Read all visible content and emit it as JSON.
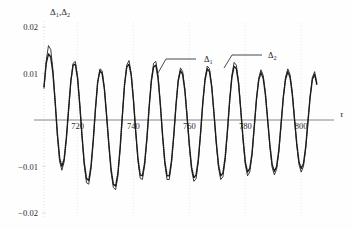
{
  "figure": {
    "background_color": "#fefefe",
    "ink_color": "#1a1a1a",
    "axis_color": "#7a7a7a",
    "gridline_color": "#d8d8d8"
  },
  "axes": {
    "ylabel": "Δ₁,Δ₂",
    "ylabel_parts": {
      "delta": "Δ",
      "sub1": "1",
      "comma": ",",
      "sub2": "2"
    },
    "xlabel": "τ",
    "x_ticks": [
      720,
      740,
      760,
      780,
      800
    ],
    "x_tick_labels": [
      "720",
      "740",
      "760",
      "780",
      "800"
    ],
    "y_ticks": [
      0.02,
      0.01,
      -0.01,
      -0.02
    ],
    "y_tick_labels": [
      "0.02",
      "0.01",
      "−0.01",
      "−0.02"
    ],
    "xlim": [
      708,
      806
    ],
    "ylim": [
      -0.022,
      0.022
    ],
    "zero_line": true,
    "grid": "faint-dotted"
  },
  "annotations": [
    {
      "name": "delta-1-callout",
      "label": "Δ₁",
      "base": "Δ",
      "sub": "1",
      "text_x": 204,
      "text_y": 62,
      "leader_from_x": 196,
      "leader_from_y": 59,
      "leader_to_x": 166,
      "leader_to_y": 59,
      "leader_tip_x": 158,
      "leader_tip_y": 73
    },
    {
      "name": "delta-2-callout",
      "label": "Δ₂",
      "base": "Δ",
      "sub": "2",
      "text_x": 268,
      "text_y": 58,
      "leader_from_x": 262,
      "leader_from_y": 55,
      "leader_to_x": 232,
      "leader_to_y": 55,
      "leader_tip_x": 224,
      "leader_tip_y": 68
    }
  ],
  "chart_data": {
    "type": "line",
    "title": "",
    "xlabel": "τ",
    "ylabel": "Δ₁,Δ₂",
    "xlim": [
      708,
      806
    ],
    "ylim": [
      -0.022,
      0.022
    ],
    "grid": false,
    "legend": "inline-callouts",
    "series": [
      {
        "name": "Δ₁",
        "style": "solid",
        "color": "#1a1a1a",
        "x": [
          708.0,
          708.8,
          709.6,
          710.4,
          711.2,
          712.0,
          712.8,
          713.6,
          714.4,
          715.2,
          716.0,
          716.8,
          717.6,
          718.4,
          719.2,
          720.0,
          720.8,
          721.6,
          722.4,
          723.2,
          724.0,
          724.8,
          725.6,
          726.4,
          727.2,
          728.0,
          728.8,
          729.6,
          730.4,
          731.2,
          732.0,
          732.8,
          733.6,
          734.4,
          735.2,
          736.0,
          736.8,
          737.6,
          738.4,
          739.2,
          740.0,
          740.8,
          741.6,
          742.4,
          743.2,
          744.0,
          744.8,
          745.6,
          746.4,
          747.2,
          748.0,
          748.8,
          749.6,
          750.4,
          751.2,
          752.0,
          752.8,
          753.6,
          754.4,
          755.2,
          756.0,
          756.8,
          757.6,
          758.4,
          759.2,
          760.0,
          760.8,
          761.6,
          762.4,
          763.2,
          764.0,
          764.8,
          765.6,
          766.4,
          767.2,
          768.0,
          768.8,
          769.6,
          770.4,
          771.2,
          772.0,
          772.8,
          773.6,
          774.4,
          775.2,
          776.0,
          776.8,
          777.6,
          778.4,
          779.2,
          780.0,
          780.8,
          781.6,
          782.4,
          783.2,
          784.0,
          784.8,
          785.6,
          786.4,
          787.2,
          788.0,
          788.8,
          789.6,
          790.4,
          791.2,
          792.0,
          792.8,
          793.6,
          794.4,
          795.2,
          796.0,
          796.8,
          797.6,
          798.4,
          799.2,
          800.0,
          800.8,
          801.6,
          802.4,
          803.2,
          804.0,
          804.8,
          805.6
        ],
        "y": [
          0.0068,
          0.0128,
          0.016,
          0.0152,
          0.0108,
          0.004,
          -0.0036,
          -0.009,
          -0.0108,
          -0.009,
          -0.0042,
          0.002,
          0.0082,
          0.0122,
          0.0126,
          0.0094,
          0.0034,
          -0.0036,
          -0.0098,
          -0.0135,
          -0.0138,
          -0.0106,
          -0.0048,
          0.0022,
          0.008,
          0.011,
          0.0106,
          0.007,
          0.001,
          -0.0056,
          -0.0112,
          -0.0145,
          -0.015,
          -0.0122,
          -0.0066,
          0.0006,
          0.0074,
          0.0118,
          0.0128,
          0.01,
          0.0044,
          -0.0026,
          -0.0088,
          -0.0125,
          -0.0128,
          -0.0098,
          -0.0042,
          0.0026,
          0.0086,
          0.0122,
          0.0126,
          0.0096,
          0.0036,
          -0.0034,
          -0.0094,
          -0.0128,
          -0.0128,
          -0.0094,
          -0.0036,
          0.003,
          0.0086,
          0.0112,
          0.0104,
          0.0066,
          0.0006,
          -0.0058,
          -0.0108,
          -0.0132,
          -0.0126,
          -0.009,
          -0.003,
          0.0036,
          0.009,
          0.0116,
          0.011,
          0.0074,
          0.0014,
          -0.005,
          -0.0102,
          -0.0128,
          -0.0122,
          -0.0086,
          -0.0026,
          0.004,
          0.0096,
          0.0124,
          0.0118,
          0.0082,
          0.002,
          -0.0044,
          -0.0096,
          -0.012,
          -0.0112,
          -0.0076,
          -0.0016,
          0.0044,
          0.009,
          0.0108,
          0.0096,
          0.0058,
          0.0,
          -0.0058,
          -0.0102,
          -0.0118,
          -0.0106,
          -0.0068,
          -0.001,
          0.0048,
          0.0092,
          0.011,
          0.0098,
          0.006,
          0.0002,
          -0.0054,
          -0.0096,
          -0.0112,
          -0.01,
          -0.0062,
          -0.0004,
          0.0052,
          0.0092,
          0.0104,
          0.008
        ]
      },
      {
        "name": "Δ₂",
        "style": "dotted",
        "color": "#1a1a1a",
        "x": [
          708.0,
          708.8,
          709.6,
          710.4,
          711.2,
          712.0,
          712.8,
          713.6,
          714.4,
          715.2,
          716.0,
          716.8,
          717.6,
          718.4,
          719.2,
          720.0,
          720.8,
          721.6,
          722.4,
          723.2,
          724.0,
          724.8,
          725.6,
          726.4,
          727.2,
          728.0,
          728.8,
          729.6,
          730.4,
          731.2,
          732.0,
          732.8,
          733.6,
          734.4,
          735.2,
          736.0,
          736.8,
          737.6,
          738.4,
          739.2,
          740.0,
          740.8,
          741.6,
          742.4,
          743.2,
          744.0,
          744.8,
          745.6,
          746.4,
          747.2,
          748.0,
          748.8,
          749.6,
          750.4,
          751.2,
          752.0,
          752.8,
          753.6,
          754.4,
          755.2,
          756.0,
          756.8,
          757.6,
          758.4,
          759.2,
          760.0,
          760.8,
          761.6,
          762.4,
          763.2,
          764.0,
          764.8,
          765.6,
          766.4,
          767.2,
          768.0,
          768.8,
          769.6,
          770.4,
          771.2,
          772.0,
          772.8,
          773.6,
          774.4,
          775.2,
          776.0,
          776.8,
          777.6,
          778.4,
          779.2,
          780.0,
          780.8,
          781.6,
          782.4,
          783.2,
          784.0,
          784.8,
          785.6,
          786.4,
          787.2,
          788.0,
          788.8,
          789.6,
          790.4,
          791.2,
          792.0,
          792.8,
          793.6,
          794.4,
          795.2,
          796.0,
          796.8,
          797.6,
          798.4,
          799.2,
          800.0,
          800.8,
          801.6,
          802.4,
          803.2,
          804.0,
          804.8,
          805.6
        ],
        "y": [
          0.0072,
          0.0122,
          0.0142,
          0.0136,
          0.01,
          0.0038,
          -0.003,
          -0.0082,
          -0.01,
          -0.0084,
          -0.0038,
          0.0024,
          0.0084,
          0.0118,
          0.012,
          0.009,
          0.0032,
          -0.0034,
          -0.0092,
          -0.0126,
          -0.013,
          -0.01,
          -0.0044,
          0.0024,
          0.0082,
          0.0106,
          0.01,
          0.0066,
          0.0008,
          -0.0052,
          -0.0106,
          -0.0138,
          -0.0142,
          -0.0116,
          -0.0062,
          0.0008,
          0.0076,
          0.0114,
          0.012,
          0.0096,
          0.0042,
          -0.0024,
          -0.0082,
          -0.0118,
          -0.012,
          -0.0092,
          -0.004,
          0.0028,
          0.0084,
          0.0114,
          0.0118,
          0.009,
          0.0034,
          -0.0032,
          -0.0088,
          -0.012,
          -0.012,
          -0.0088,
          -0.0034,
          0.0032,
          0.0084,
          0.0106,
          0.0098,
          0.0062,
          0.0006,
          -0.0054,
          -0.0102,
          -0.0124,
          -0.0118,
          -0.0084,
          -0.0028,
          0.0038,
          0.0086,
          0.011,
          0.0104,
          0.007,
          0.0014,
          -0.0046,
          -0.0096,
          -0.012,
          -0.0114,
          -0.008,
          -0.0024,
          0.0042,
          0.0092,
          0.0116,
          0.011,
          0.0078,
          0.002,
          -0.004,
          -0.009,
          -0.0112,
          -0.0104,
          -0.0072,
          -0.0014,
          0.0046,
          0.0086,
          0.0102,
          0.009,
          0.0054,
          0.0,
          -0.0054,
          -0.0096,
          -0.011,
          -0.01,
          -0.0064,
          -0.0008,
          0.005,
          0.0088,
          0.0104,
          0.0092,
          0.0056,
          0.0002,
          -0.005,
          -0.009,
          -0.0104,
          -0.0094,
          -0.0058,
          -0.0004,
          0.005,
          0.0088,
          0.0098,
          0.0076
        ]
      }
    ]
  }
}
